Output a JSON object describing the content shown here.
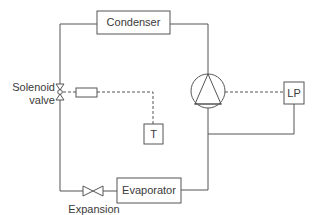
{
  "diagram": {
    "type": "refrigeration-cycle-schematic",
    "components": {
      "condenser": {
        "label": "Condenser"
      },
      "evaporator": {
        "label": "Evaporator"
      },
      "compressor": {
        "label": ""
      },
      "lp_switch": {
        "label": "LP"
      },
      "thermostat": {
        "label": "T"
      },
      "solenoid_valve": {
        "label_line1": "Solenoid",
        "label_line2": "valve"
      },
      "expansion_valve": {
        "label_line1": "Expansion",
        "label_line2": "valve"
      }
    },
    "colors": {
      "line": "#555555",
      "text": "#3a3a3a",
      "background": "#ffffff"
    }
  }
}
